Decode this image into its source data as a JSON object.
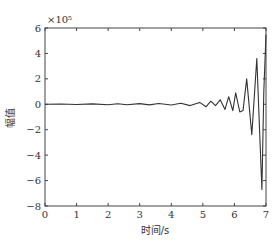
{
  "chart_data": {
    "type": "line",
    "title": "",
    "xlabel": "时间/s",
    "ylabel": "幅值",
    "y_scale_annotation": "×10⁵",
    "xlim": [
      0,
      7
    ],
    "ylim": [
      -8,
      6
    ],
    "x_ticks": [
      "0",
      "1",
      "2",
      "3",
      "4",
      "5",
      "6",
      "7"
    ],
    "y_ticks": [
      "6",
      "4",
      "2",
      "0",
      "−2",
      "−4",
      "−6",
      "−8"
    ],
    "grid": false,
    "legend": null,
    "series": [
      {
        "name": "幅值",
        "color": "#333333",
        "x": [
          0,
          0.5,
          1.0,
          1.5,
          2.0,
          2.3,
          2.6,
          3.0,
          3.3,
          3.6,
          4.0,
          4.3,
          4.6,
          4.9,
          5.1,
          5.25,
          5.4,
          5.55,
          5.7,
          5.82,
          5.95,
          6.04,
          6.17,
          6.27,
          6.39,
          6.55,
          6.71,
          6.87,
          6.93,
          7.0
        ],
        "values": [
          0,
          0.02,
          -0.02,
          0.03,
          -0.03,
          0.04,
          -0.04,
          0.05,
          -0.05,
          0.06,
          -0.06,
          0.08,
          -0.1,
          0.15,
          -0.2,
          0.25,
          -0.1,
          0.35,
          -0.4,
          0.6,
          -0.5,
          0.9,
          -0.6,
          -0.5,
          2.0,
          -2.4,
          3.6,
          -6.7,
          1.0,
          5.5
        ]
      }
    ]
  }
}
